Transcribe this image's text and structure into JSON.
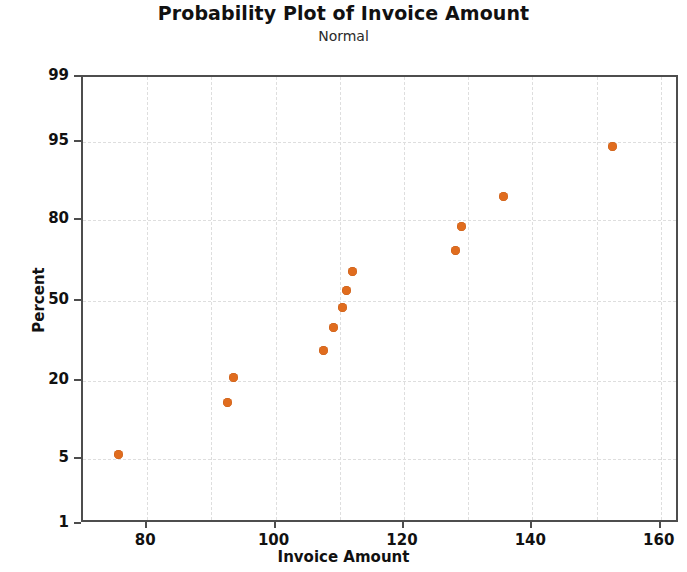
{
  "chart_data": {
    "type": "scatter",
    "title": "Probability Plot of Invoice Amount",
    "subtitle": "Normal",
    "xlabel": "Invoice Amount",
    "ylabel": "Percent",
    "xlim": [
      70,
      163
    ],
    "ylim": [
      1,
      99
    ],
    "yscale": "normal-probability",
    "grid": true,
    "legend": "none",
    "x_ticks": [
      80,
      100,
      120,
      140,
      160
    ],
    "x_tick_labels": [
      "80",
      "100",
      "120",
      "140",
      "160"
    ],
    "x_minor_gridlines": [
      90,
      110,
      130,
      150
    ],
    "y_ticks": [
      1,
      5,
      20,
      50,
      80,
      95,
      99
    ],
    "y_tick_labels": [
      "1",
      "5",
      "20",
      "50",
      "80",
      "95",
      "99"
    ],
    "marker_color": "#e06c1e",
    "grid_color": "#dedede",
    "axis_color": "#4d4d4d",
    "points": [
      {
        "x": 75.5,
        "y": 5.5
      },
      {
        "x": 92.5,
        "y": 14.5
      },
      {
        "x": 93.5,
        "y": 21.0
      },
      {
        "x": 107.5,
        "y": 30.0
      },
      {
        "x": 109.0,
        "y": 39.0
      },
      {
        "x": 110.5,
        "y": 47.0
      },
      {
        "x": 111.0,
        "y": 54.0
      },
      {
        "x": 112.0,
        "y": 62.0
      },
      {
        "x": 128.0,
        "y": 70.0
      },
      {
        "x": 129.0,
        "y": 78.0
      },
      {
        "x": 135.5,
        "y": 86.0
      },
      {
        "x": 152.5,
        "y": 94.5
      }
    ],
    "n_points": 12
  }
}
